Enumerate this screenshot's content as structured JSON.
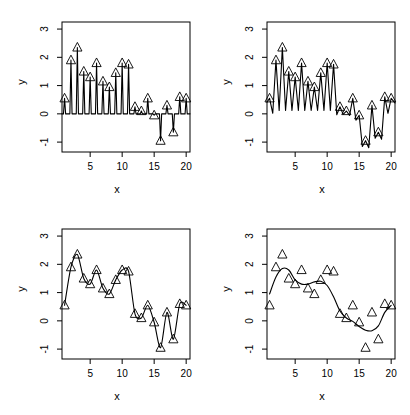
{
  "figure": {
    "panel_count": 4,
    "axis": {
      "xlabel": "x",
      "ylabel": "y",
      "xticks": [
        5,
        10,
        15,
        20
      ],
      "yticks": [
        3,
        2,
        1,
        0,
        -1
      ],
      "xlim": [
        0.6,
        20.6
      ],
      "ylim": [
        -1.35,
        3.25
      ],
      "grid": false,
      "frame": true
    },
    "marker": "triangle-up-open",
    "line_color": "#000000"
  },
  "chart_data": [
    {
      "type": "line",
      "title": "",
      "xlabel": "x",
      "ylabel": "y",
      "xlim": [
        0.6,
        20.6
      ],
      "ylim": [
        -1.35,
        3.25
      ],
      "grid": false,
      "legend": "none",
      "x": [
        1,
        2,
        3,
        4,
        5,
        6,
        7,
        8,
        9,
        10,
        11,
        12,
        13,
        14,
        15,
        16,
        17,
        18,
        19,
        20
      ],
      "values": [
        0.55,
        1.9,
        2.35,
        1.5,
        1.3,
        1.8,
        1.15,
        0.95,
        1.45,
        1.8,
        1.75,
        0.25,
        0.1,
        0.55,
        -0.05,
        -0.95,
        0.3,
        -0.65,
        0.6,
        0.55
      ],
      "series": [
        {
          "name": "observed",
          "type": "scatter",
          "values": [
            0.55,
            1.9,
            2.35,
            1.5,
            1.3,
            1.8,
            1.15,
            0.95,
            1.45,
            1.8,
            1.75,
            0.25,
            0.1,
            0.55,
            -0.05,
            -0.95,
            0.3,
            -0.65,
            0.6,
            0.55
          ]
        },
        {
          "name": "fit-spike",
          "type": "line",
          "note": "near-zero bandwidth fit: narrow spikes to each datum, baseline near 0"
        }
      ]
    },
    {
      "type": "line",
      "title": "",
      "xlabel": "x",
      "ylabel": "y",
      "xlim": [
        0.6,
        20.6
      ],
      "ylim": [
        -1.35,
        3.25
      ],
      "grid": false,
      "legend": "none",
      "x": [
        1,
        2,
        3,
        4,
        5,
        6,
        7,
        8,
        9,
        10,
        11,
        12,
        13,
        14,
        15,
        16,
        17,
        18,
        19,
        20
      ],
      "values": [
        0.55,
        1.9,
        2.35,
        1.5,
        1.3,
        1.8,
        1.15,
        0.95,
        1.45,
        1.8,
        1.75,
        0.25,
        0.1,
        0.55,
        -0.05,
        -0.95,
        0.3,
        -0.65,
        0.6,
        0.55
      ],
      "series": [
        {
          "name": "observed",
          "type": "scatter",
          "values": [
            0.55,
            1.9,
            2.35,
            1.5,
            1.3,
            1.8,
            1.15,
            0.95,
            1.45,
            1.8,
            1.75,
            0.25,
            0.1,
            0.55,
            -0.05,
            -0.95,
            0.3,
            -0.65,
            0.6,
            0.55
          ]
        },
        {
          "name": "fit-oscillating",
          "type": "line",
          "note": "small bandwidth fit: sharp V oscillations dipping toward 0 between points"
        }
      ]
    },
    {
      "type": "line",
      "title": "",
      "xlabel": "x",
      "ylabel": "y",
      "xlim": [
        0.6,
        20.6
      ],
      "ylim": [
        -1.35,
        3.25
      ],
      "grid": false,
      "legend": "none",
      "x": [
        1,
        2,
        3,
        4,
        5,
        6,
        7,
        8,
        9,
        10,
        11,
        12,
        13,
        14,
        15,
        16,
        17,
        18,
        19,
        20
      ],
      "values": [
        0.55,
        1.9,
        2.35,
        1.5,
        1.3,
        1.8,
        1.15,
        0.95,
        1.45,
        1.8,
        1.75,
        0.25,
        0.1,
        0.55,
        -0.05,
        -0.95,
        0.3,
        -0.65,
        0.6,
        0.55
      ],
      "series": [
        {
          "name": "observed",
          "type": "scatter",
          "values": [
            0.55,
            1.9,
            2.35,
            1.5,
            1.3,
            1.8,
            1.15,
            0.95,
            1.45,
            1.8,
            1.75,
            0.25,
            0.1,
            0.55,
            -0.05,
            -0.95,
            0.3,
            -0.65,
            0.6,
            0.55
          ]
        },
        {
          "name": "fit-interpolating",
          "type": "line",
          "note": "moderate bandwidth fit: smooth curve passing essentially through all points"
        }
      ]
    },
    {
      "type": "line",
      "title": "",
      "xlabel": "x",
      "ylabel": "y",
      "xlim": [
        0.6,
        20.6
      ],
      "ylim": [
        -1.35,
        3.25
      ],
      "grid": false,
      "legend": "none",
      "x": [
        1,
        2,
        3,
        4,
        5,
        6,
        7,
        8,
        9,
        10,
        11,
        12,
        13,
        14,
        15,
        16,
        17,
        18,
        19,
        20
      ],
      "values": [
        0.55,
        1.9,
        2.35,
        1.5,
        1.3,
        1.8,
        1.15,
        0.95,
        1.45,
        1.8,
        1.75,
        0.25,
        0.1,
        0.55,
        -0.05,
        -0.95,
        0.3,
        -0.65,
        0.6,
        0.55
      ],
      "series": [
        {
          "name": "observed",
          "type": "scatter",
          "values": [
            0.55,
            1.9,
            2.35,
            1.5,
            1.3,
            1.8,
            1.15,
            0.95,
            1.45,
            1.8,
            1.75,
            0.25,
            0.1,
            0.55,
            -0.05,
            -0.95,
            0.3,
            -0.65,
            0.6,
            0.55
          ]
        },
        {
          "name": "fit-smooth",
          "type": "line",
          "smoothed_values": [
            0.95,
            1.55,
            1.85,
            1.8,
            1.45,
            1.3,
            1.3,
            1.38,
            1.4,
            1.25,
            0.85,
            0.35,
            0.1,
            -0.02,
            -0.2,
            -0.33,
            -0.35,
            -0.18,
            0.3,
            0.55
          ],
          "note": "large bandwidth fit: heavily smoothed trend curve"
        }
      ]
    }
  ]
}
